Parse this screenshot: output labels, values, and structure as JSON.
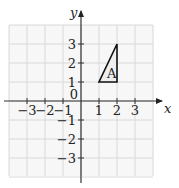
{
  "diagram": {
    "type": "coordinate-grid",
    "x_axis_label": "x",
    "y_axis_label": "y",
    "x_range": [
      -4,
      4
    ],
    "y_range": [
      -4,
      4
    ],
    "origin_label": "0",
    "x_ticks": [
      {
        "value": -3,
        "label": "−3"
      },
      {
        "value": -2,
        "label": "−2"
      },
      {
        "value": -1,
        "label": "−1"
      },
      {
        "value": 1,
        "label": "1"
      },
      {
        "value": 2,
        "label": "2"
      },
      {
        "value": 3,
        "label": "3"
      }
    ],
    "y_ticks": [
      {
        "value": 3,
        "label": "3"
      },
      {
        "value": 2,
        "label": "2"
      },
      {
        "value": 1,
        "label": "1"
      },
      {
        "value": -1,
        "label": "−1"
      },
      {
        "value": -2,
        "label": "−2"
      },
      {
        "value": -3,
        "label": "−3"
      }
    ],
    "shape": {
      "name": "triangle",
      "label": "A",
      "vertices": [
        [
          1,
          1
        ],
        [
          2,
          1
        ],
        [
          2,
          3
        ]
      ],
      "fill": "#eeeeee",
      "stroke": "#111111"
    },
    "colors": {
      "grid": "#d8d8d8",
      "grid_fill": "#f7f7f7",
      "axis": "#333333"
    }
  }
}
